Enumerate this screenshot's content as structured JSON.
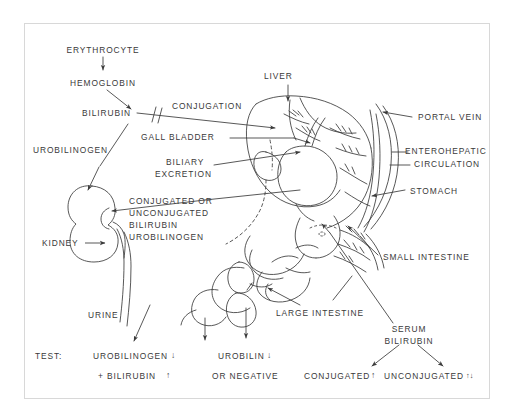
{
  "diagram": {
    "ink_color": "#3a3a3a",
    "frame_color": "#d8d8d8",
    "background": "#ffffff",
    "labels": {
      "erythrocyte": "ERYTHROCYTE",
      "hemoglobin": "HEMOGLOBIN",
      "bilirubin": "BILIRUBIN",
      "conjugation": "CONJUGATION",
      "liver": "LIVER",
      "portal_vein": "PORTAL  VEIN",
      "enterohepatic": "ENTEROHEPATIC",
      "circulation": "CIRCULATION",
      "gall_bladder": "GALL BLADDER",
      "biliary": "BILIARY",
      "excretion": "EXCRETION",
      "urobilinogen_left": "UROBILINOGEN",
      "stomach": "STOMACH",
      "conj_or": "CONJUGATED OR",
      "unconjugated": "UNCONJUGATED",
      "bilirubin2": "BILIRUBIN",
      "urobilinogen2": "UROBILINOGEN",
      "kidney": "KIDNEY",
      "small_intestine": "SMALL INTESTINE",
      "large_intestine": "LARGE INTESTINE",
      "urine": "URINE",
      "test": "TEST:",
      "test_urobilinogen": "UROBILINOGEN",
      "test_urobilinogen_arrow": "↓",
      "test_bilirubin": "+ BILIRUBIN",
      "test_bilirubin_arrow": "↑",
      "urobilin": "UROBILIN",
      "urobilin_arrow": "↓",
      "or_negative": "OR NEGATIVE",
      "serum": "SERUM",
      "serum_bilirubin": "BILIRUBIN",
      "conjugated_result": "CONJUGATED",
      "conjugated_arrow": "↑",
      "unconjugated_result": "UNCONJUGATED",
      "unconjugated_arrow": "↑↓"
    }
  }
}
